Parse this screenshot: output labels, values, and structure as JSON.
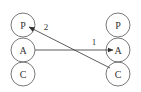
{
  "diagram": {
    "type": "transactional-analysis-ego-states",
    "colors": {
      "background": "#ffffff",
      "stroke": "#555555",
      "text": "#333333"
    },
    "left_person": {
      "states": [
        {
          "label": "P",
          "cx": 23,
          "cy": 25
        },
        {
          "label": "A",
          "cx": 23,
          "cy": 50
        },
        {
          "label": "C",
          "cx": 23,
          "cy": 74
        }
      ]
    },
    "right_person": {
      "states": [
        {
          "label": "P",
          "cx": 118,
          "cy": 25
        },
        {
          "label": "A",
          "cx": 118,
          "cy": 50
        },
        {
          "label": "C",
          "cx": 118,
          "cy": 74
        }
      ]
    },
    "radius": 12,
    "transactions": [
      {
        "label": "1",
        "from": "left.A",
        "to": "right.A",
        "label_x": 94,
        "label_y": 45
      },
      {
        "label": "2",
        "from": "right.C",
        "to": "left.P",
        "label_x": 46,
        "label_y": 30
      }
    ]
  }
}
